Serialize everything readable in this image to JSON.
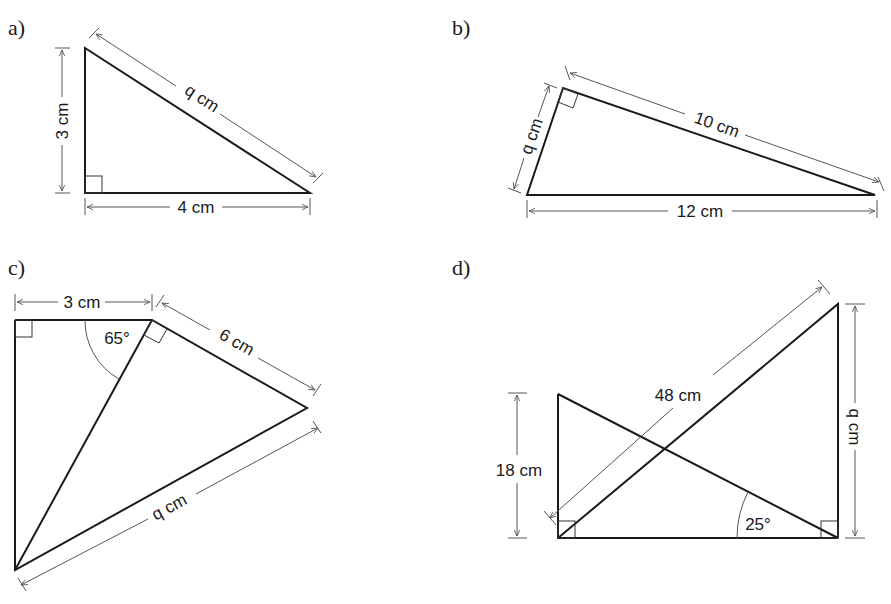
{
  "figures": [
    {
      "id": "a",
      "label": "a)",
      "dimensions": {
        "vertical": "3 cm",
        "horizontal": "4 cm",
        "hypotenuse": "q cm"
      },
      "right_angle": "bottom-left"
    },
    {
      "id": "b",
      "label": "b)",
      "dimensions": {
        "short_leg": "q cm",
        "long_leg": "10 cm",
        "hypotenuse": "12 cm"
      },
      "right_angle": "top"
    },
    {
      "id": "c",
      "label": "c)",
      "dimensions": {
        "top": "3 cm",
        "upper_right": "6 cm",
        "lower_right": "q cm"
      },
      "angles": {
        "top": "65°"
      },
      "right_angles": [
        "top-left",
        "top-right-vertex"
      ]
    },
    {
      "id": "d",
      "label": "d)",
      "dimensions": {
        "left_height": "18 cm",
        "diagonal": "48 cm",
        "right_height": "q cm"
      },
      "angles": {
        "bottom_right": "25°"
      },
      "right_angles": [
        "bottom-left",
        "bottom-right"
      ]
    }
  ]
}
